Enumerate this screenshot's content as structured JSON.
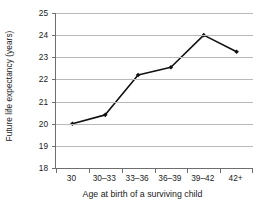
{
  "chart_data": {
    "type": "line",
    "title": "",
    "xlabel": "Age at birth of a surviving child",
    "ylabel": "Future life expectancy (years)",
    "categories": [
      "30",
      "30–33",
      "33–36",
      "36–39",
      "39–42",
      "42+"
    ],
    "values": [
      20.0,
      20.4,
      22.2,
      22.55,
      24.0,
      23.25
    ],
    "ylim": [
      18,
      25
    ],
    "yticks": [
      18,
      19,
      20,
      21,
      22,
      23,
      24,
      25
    ],
    "ytick_labels": [
      "18",
      "19",
      "20",
      "21",
      "22",
      "23",
      "24",
      "25"
    ],
    "grid": true,
    "grid_axis": "y",
    "legend": false,
    "legend_position": "none",
    "series": [
      {
        "name": "Future life expectancy",
        "values": [
          20.0,
          20.4,
          22.2,
          22.55,
          24.0,
          23.25
        ],
        "line_color": "#111111",
        "marker": "diamond",
        "marker_color": "#111111"
      }
    ],
    "colors": {
      "line": "#111111",
      "marker": "#111111",
      "gridline": "#b9b9b9",
      "axis": "#6e6e6e",
      "text": "#1a1a1a",
      "background": "#ffffff"
    }
  }
}
